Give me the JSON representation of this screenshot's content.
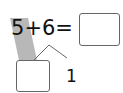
{
  "equation": {
    "left": "5",
    "op": "+",
    "right": "6",
    "eq": "="
  },
  "answer_box": {
    "value": ""
  },
  "decomposition": {
    "part1_box": {
      "value": ""
    },
    "part2": "1"
  },
  "colors": {
    "band": "#b0b0b0",
    "stroke": "#666666"
  }
}
